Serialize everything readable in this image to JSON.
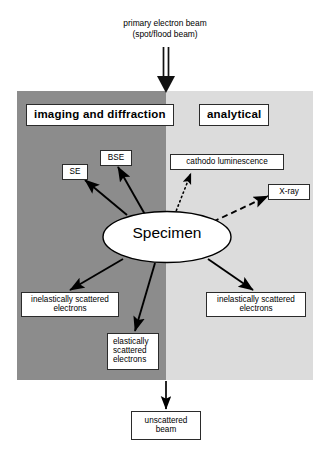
{
  "figure": {
    "background_color": "#ffffff"
  },
  "beam": {
    "caption": "primary electron beam\n(spot/flood beam)",
    "direction": "downward",
    "arrow_style": "thick double line with solid triangular head"
  },
  "panels": [
    {
      "id": "imaging",
      "header": "imaging and diffraction",
      "fill_color": "#8c8c8c",
      "side": "left"
    },
    {
      "id": "analytical",
      "header": "analytical",
      "fill_color": "#dcdcdc",
      "side": "right"
    }
  ],
  "specimen": {
    "label": "Specimen",
    "shape": "ellipse",
    "fill_color": "#ffffff",
    "stroke_color": "#000000"
  },
  "signals": [
    {
      "id": "se",
      "label": "SE",
      "line_style": "solid",
      "panel": "imaging"
    },
    {
      "id": "bse",
      "label": "BSE",
      "line_style": "solid",
      "panel": "imaging"
    },
    {
      "id": "cathodoluminescence",
      "label": "cathodo luminescence",
      "line_style": "dotted",
      "panel": "analytical"
    },
    {
      "id": "xray",
      "label": "X-ray",
      "line_style": "dashed",
      "panel": "analytical"
    },
    {
      "id": "inelastic-left",
      "label": "inelastically scattered\nelectrons",
      "line_style": "solid",
      "panel": "imaging"
    },
    {
      "id": "inelastic-right",
      "label": "inelastically scattered\nelectrons",
      "line_style": "solid",
      "panel": "analytical"
    },
    {
      "id": "elastic",
      "label": "elastically\nscattered\nelectrons",
      "line_style": "solid",
      "panel": "imaging"
    },
    {
      "id": "unscattered",
      "label": "unscattered\nbeam",
      "line_style": "solid",
      "panel": "below"
    }
  ],
  "colors": {
    "line": "#000000",
    "box_border": "#2b2b2b",
    "box_fill": "#ffffff",
    "panel_left": "#8c8c8c",
    "panel_right": "#dcdcdc"
  }
}
